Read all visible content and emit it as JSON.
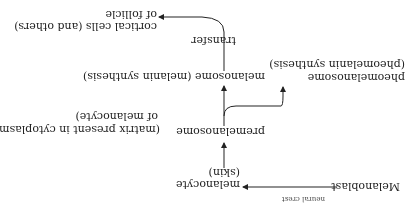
{
  "diagram": {
    "orientation": "rotated 180 degrees",
    "nodes": {
      "melanoblast": "Melanoblast",
      "neural_crest": "neural crest",
      "melanocyte": "melanocyte",
      "melanocyte_note": "(skin)",
      "premelanosome": "premelanosome",
      "premelanosome_note_1": "(matrix present in cytoplasm",
      "premelanosome_note_2": "of melanocyte)",
      "melanosome": "melanosome (melanin synthesis)",
      "pheomelanosome": "pheomelanosome",
      "pheomelanosome_note": "(pheomelanin synthesis)",
      "transfer": "transfer",
      "cortical_1": "cortical cells (and others)",
      "cortical_2": "of follicle"
    },
    "edges": [
      {
        "from": "Melanoblast",
        "to": "melanocyte",
        "label": "neural crest"
      },
      {
        "from": "melanocyte",
        "to": "premelanosome"
      },
      {
        "from": "premelanosome",
        "to": "melanosome"
      },
      {
        "from": "premelanosome",
        "to": "pheomelanosome"
      },
      {
        "from": "melanosome",
        "to": "cortical cells (and others) of follicle",
        "label": "transfer"
      }
    ],
    "colors": {
      "ink": "#222222",
      "background": "#ffffff"
    }
  }
}
